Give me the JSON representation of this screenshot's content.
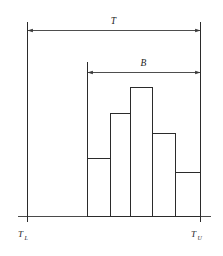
{
  "figure": {
    "background_color": "#ffffff",
    "line_color": "#2b2b2b",
    "dimension_labels": {
      "total_tolerance": "T",
      "process_spread": "B"
    },
    "axis_labels": {
      "lower_limit_main": "T",
      "lower_limit_sub": "L",
      "upper_limit_main": "T",
      "upper_limit_sub": "U"
    }
  },
  "chart_data": {
    "type": "bar",
    "title": "",
    "xlabel": "",
    "ylabel": "",
    "grid": false,
    "legend_position": "none",
    "categories": [
      "1",
      "2",
      "3",
      "4",
      "5"
    ],
    "values": [
      58,
      103,
      129,
      83,
      44
    ],
    "bar_edges_px": [
      87,
      110,
      130,
      152,
      175,
      200
    ],
    "bar_top_px": [
      158,
      113,
      87,
      133,
      172
    ],
    "baseline_px": 216,
    "ylim": [
      0,
      194
    ],
    "annotations": [
      {
        "label": "T",
        "kind": "double-arrow-dimension",
        "from_px": 27,
        "to_px": 200,
        "y_px": 30,
        "meaning": "total tolerance width between lower and upper limits"
      },
      {
        "label": "B",
        "kind": "double-arrow-dimension",
        "from_px": 87,
        "to_px": 200,
        "y_px": 72,
        "meaning": "process spread width of the histogram"
      }
    ],
    "limit_lines": [
      {
        "name": "lower-tolerance-limit",
        "x_px": 27,
        "label": "T_L"
      },
      {
        "name": "upper-tolerance-limit",
        "x_px": 200,
        "label": "T_U"
      }
    ]
  }
}
